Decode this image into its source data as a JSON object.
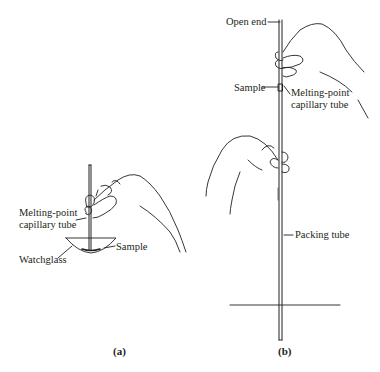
{
  "panel_a": {
    "caption": "(a)",
    "labels": {
      "capillary_line1": "Melting-point",
      "capillary_line2": "capillary tube",
      "sample": "Sample",
      "watchglass": "Watchglass"
    }
  },
  "panel_b": {
    "caption": "(b)",
    "labels": {
      "open_end": "Open end",
      "sample": "Sample",
      "capillary_line1": "Melting-point",
      "capillary_line2": "capillary tube",
      "packing_tube": "Packing tube"
    }
  },
  "colors": {
    "ink": "#231f20",
    "background": "#ffffff"
  }
}
